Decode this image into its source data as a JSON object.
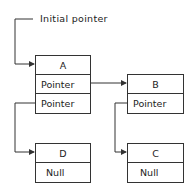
{
  "diagram": {
    "title_label": "Initial pointer",
    "nodes": {
      "A": {
        "name": "A",
        "fields": [
          "Pointer",
          "Pointer"
        ]
      },
      "B": {
        "name": "B",
        "fields": [
          "Pointer"
        ]
      },
      "C": {
        "name": "C",
        "fields": [
          "Null"
        ]
      },
      "D": {
        "name": "D",
        "fields": [
          "Null"
        ]
      }
    },
    "edges": [
      {
        "from": "Initial pointer",
        "to": "A"
      },
      {
        "from": "A.field0",
        "to": "B"
      },
      {
        "from": "A.field1",
        "to": "D"
      },
      {
        "from": "B.field0",
        "to": "C"
      }
    ]
  }
}
